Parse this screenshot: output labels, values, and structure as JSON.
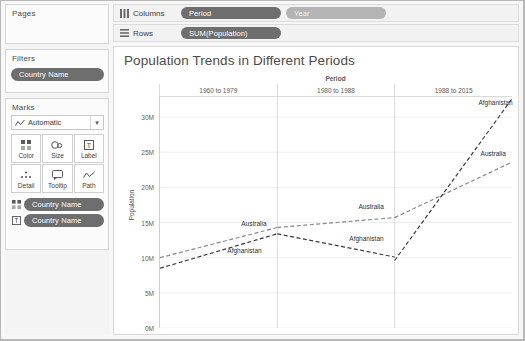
{
  "left_panel": {
    "pages": {
      "title": "Pages"
    },
    "filters": {
      "title": "Filters",
      "pill": "Country Name"
    },
    "marks": {
      "title": "Marks",
      "mark_type": "Automatic",
      "mark_type_icon": "line-chart-icon",
      "caret_icon": "chevron-down-icon",
      "buttons": [
        {
          "label": "Color",
          "icon": "color-squares-icon"
        },
        {
          "label": "Size",
          "icon": "size-circles-icon"
        },
        {
          "label": "Label",
          "icon": "label-tag-icon"
        },
        {
          "label": "Detail",
          "icon": "detail-dots-icon"
        },
        {
          "label": "Tooltip",
          "icon": "tooltip-bubble-icon"
        },
        {
          "label": "Path",
          "icon": "path-line-icon"
        }
      ],
      "pills": [
        {
          "icon": "color-squares-icon",
          "label": "Country Name"
        },
        {
          "icon": "label-tag-icon",
          "label": "Country Name"
        }
      ]
    }
  },
  "shelves": {
    "columns": {
      "label": "Columns",
      "icon": "columns-icon",
      "pills": [
        {
          "label": "Period",
          "style": "dark"
        },
        {
          "label": "Year",
          "style": "light"
        }
      ]
    },
    "rows": {
      "label": "Rows",
      "icon": "rows-icon",
      "pills": [
        {
          "label": "SUM(Population)",
          "style": "dark"
        }
      ]
    }
  },
  "viz": {
    "title": "Population Trends in Different Periods"
  },
  "chart_data": {
    "type": "line",
    "title": "Population Trends in Different Periods",
    "xlabel": "Period",
    "ylabel": "Population",
    "grid": true,
    "legend": "inline-labels",
    "ylim": [
      0,
      33000000
    ],
    "yticks": [
      "0M",
      "5M",
      "10M",
      "15M",
      "20M",
      "25M",
      "30M"
    ],
    "ytick_values": [
      0,
      5000000,
      10000000,
      15000000,
      20000000,
      25000000,
      30000000
    ],
    "panels": [
      {
        "category": "1960 to 1979",
        "series": [
          {
            "name": "Australia",
            "values": [
              10000000,
              14300000
            ],
            "color": "#8a8a8a"
          },
          {
            "name": "Afghanistan",
            "values": [
              8500000,
              13400000
            ],
            "color": "#3c3c3c"
          }
        ]
      },
      {
        "category": "1980 to 1988",
        "series": [
          {
            "name": "Australia",
            "values": [
              14300000,
              15700000
            ],
            "color": "#8a8a8a"
          },
          {
            "name": "Afghanistan",
            "values": [
              13400000,
              10100000
            ],
            "color": "#3c3c3c"
          }
        ]
      },
      {
        "category": "1988 to 2015",
        "series": [
          {
            "name": "Australia",
            "values": [
              15700000,
              23600000
            ],
            "color": "#8a8a8a"
          },
          {
            "name": "Afghanistan",
            "values": [
              9600000,
              32600000
            ],
            "color": "#3c3c3c"
          }
        ]
      }
    ],
    "annotations": [
      {
        "text": "Australia",
        "panel": 0,
        "x_frac": 0.8,
        "y_value": 14900000
      },
      {
        "text": "Afghanistan",
        "panel": 0,
        "x_frac": 0.72,
        "y_value": 11100000
      },
      {
        "text": "Australia",
        "panel": 1,
        "x_frac": 0.8,
        "y_value": 17400000
      },
      {
        "text": "Afghanistan",
        "panel": 1,
        "x_frac": 0.76,
        "y_value": 12800000
      },
      {
        "text": "Australia",
        "panel": 2,
        "x_frac": 0.84,
        "y_value": 24900000
      },
      {
        "text": "Afghanistan",
        "panel": 2,
        "x_frac": 0.86,
        "y_value": 32200000
      }
    ]
  }
}
